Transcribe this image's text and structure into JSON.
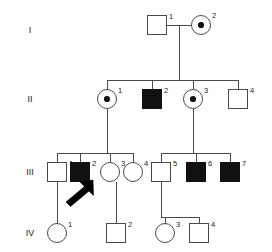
{
  "figure": {
    "type": "pedigree-chart",
    "width": 272,
    "height": 252,
    "background_color": "#ffffff",
    "line_color": "#4a4a4a",
    "affected_fill_color": "#111111",
    "unaffected_fill_color": "#ffffff",
    "label_color": "#1a1a1a"
  },
  "generations": [
    {
      "label": "I",
      "y": 30
    },
    {
      "label": "II",
      "y": 99
    },
    {
      "label": "III",
      "y": 172
    },
    {
      "label": "IV",
      "y": 233
    }
  ],
  "individuals": [
    {
      "generation": "I",
      "id": "1",
      "sex": "male",
      "shape": "square",
      "status": "unaffected",
      "cx": 157,
      "cy": 25,
      "size": 19
    },
    {
      "generation": "I",
      "id": "2",
      "sex": "female",
      "shape": "circle",
      "status": "carrier",
      "cx": 201,
      "cy": 25,
      "size": 19
    },
    {
      "generation": "II",
      "id": "1",
      "sex": "female",
      "shape": "circle",
      "status": "carrier",
      "cx": 107,
      "cy": 99,
      "size": 19
    },
    {
      "generation": "II",
      "id": "2",
      "sex": "male",
      "shape": "square",
      "status": "affected",
      "cx": 152,
      "cy": 99,
      "size": 19
    },
    {
      "generation": "II",
      "id": "3",
      "sex": "female",
      "shape": "circle",
      "status": "carrier",
      "cx": 193,
      "cy": 99,
      "size": 19
    },
    {
      "generation": "II",
      "id": "4",
      "sex": "male",
      "shape": "square",
      "status": "unaffected",
      "cx": 238,
      "cy": 99,
      "size": 19
    },
    {
      "generation": "III",
      "id": "1",
      "sex": "male",
      "shape": "square",
      "status": "unaffected",
      "cx": 57,
      "cy": 172,
      "size": 19
    },
    {
      "generation": "III",
      "id": "2",
      "sex": "male",
      "shape": "square",
      "status": "affected",
      "cx": 80,
      "cy": 172,
      "size": 19
    },
    {
      "generation": "III",
      "id": "3",
      "sex": "female",
      "shape": "circle",
      "status": "unaffected",
      "cx": 110,
      "cy": 172,
      "size": 19
    },
    {
      "generation": "III",
      "id": "4",
      "sex": "female",
      "shape": "circle",
      "status": "unaffected",
      "cx": 133,
      "cy": 172,
      "size": 19
    },
    {
      "generation": "III",
      "id": "5",
      "sex": "male",
      "shape": "square",
      "status": "unaffected",
      "cx": 161,
      "cy": 172,
      "size": 19
    },
    {
      "generation": "III",
      "id": "6",
      "sex": "male",
      "shape": "square",
      "status": "affected",
      "cx": 196,
      "cy": 172,
      "size": 19
    },
    {
      "generation": "III",
      "id": "7",
      "sex": "male",
      "shape": "square",
      "status": "affected",
      "cx": 230,
      "cy": 172,
      "size": 19
    },
    {
      "generation": "IV",
      "id": "1",
      "sex": "female",
      "shape": "circle",
      "status": "unaffected",
      "cx": 57,
      "cy": 233,
      "size": 19
    },
    {
      "generation": "IV",
      "id": "2",
      "sex": "male",
      "shape": "square",
      "status": "unaffected",
      "cx": 116,
      "cy": 233,
      "size": 19
    },
    {
      "generation": "IV",
      "id": "3",
      "sex": "female",
      "shape": "circle",
      "status": "unaffected",
      "cx": 165,
      "cy": 233,
      "size": 19
    },
    {
      "generation": "IV",
      "id": "4",
      "sex": "male",
      "shape": "square",
      "status": "unaffected",
      "cx": 199,
      "cy": 233,
      "size": 19
    }
  ],
  "proband": {
    "points_to": "III-2",
    "arrow_tail_x": 66,
    "arrow_tail_y": 203,
    "arrow_tip_x": 93,
    "arrow_tip_y": 181
  },
  "legend_note": {
    "carrier_symbol": "circle-with-center-dot",
    "affected_symbol": "filled-square"
  }
}
